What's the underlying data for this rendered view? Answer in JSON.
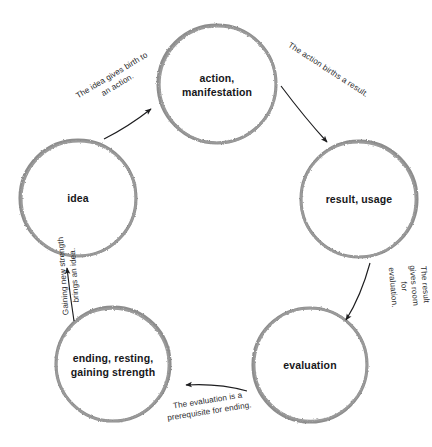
{
  "diagram": {
    "type": "cycle-diagram",
    "background_color": "#ffffff",
    "circle_stroke_color": "#8d8d8d",
    "arrow_color": "#1d1d1f",
    "node_text_color": "#17171a",
    "edge_text_color": "#2a2a2d",
    "nodes": [
      {
        "id": "action",
        "label": "action,\nmanifestation",
        "cx": 217,
        "cy": 84,
        "r": 59
      },
      {
        "id": "result",
        "label": "result, usage",
        "cx": 359,
        "cy": 199,
        "r": 58
      },
      {
        "id": "evaluation",
        "label": "evaluation",
        "cx": 310,
        "cy": 365,
        "r": 57
      },
      {
        "id": "ending",
        "label": "ending, resting,\ngaining strength",
        "cx": 113,
        "cy": 364,
        "r": 57
      },
      {
        "id": "idea",
        "label": "idea",
        "cx": 78,
        "cy": 198,
        "r": 58
      }
    ],
    "edges": [
      {
        "id": "idea-to-action",
        "label": "The idea gives birth to\nan action.",
        "from": "idea",
        "to": "action",
        "label_x": 74,
        "label_y": 70,
        "rotation": -31
      },
      {
        "id": "action-to-result",
        "label": "The action births a result.",
        "from": "action",
        "to": "result",
        "label_x": 281,
        "label_y": 65,
        "rotation": 33
      },
      {
        "id": "result-to-evaluation",
        "label": "The result gives room\nfor evaluation.",
        "from": "result",
        "to": "evaluation",
        "label_x": 385,
        "label_y": 265,
        "rotation": 85
      },
      {
        "id": "evaluation-to-ending",
        "label": "The evaluation is a\nprerequisite for ending.",
        "from": "evaluation",
        "to": "ending",
        "label_x": 166,
        "label_y": 396,
        "rotation": -9
      },
      {
        "id": "ending-to-idea",
        "label": "Gaining new strength\nbrings an idea.",
        "from": "ending",
        "to": "idea",
        "label_x": 30,
        "label_y": 265,
        "rotation": -94
      }
    ]
  }
}
